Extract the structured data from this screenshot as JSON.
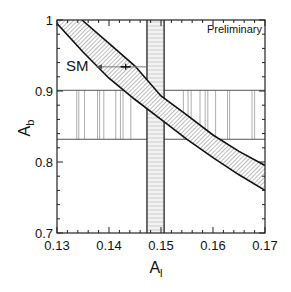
{
  "chart_data": {
    "type": "line",
    "title": "",
    "xlabel": "A",
    "xlabel_sub": "l",
    "ylabel": "A",
    "ylabel_sub": "b",
    "xlim": [
      0.13,
      0.17
    ],
    "ylim": [
      0.7,
      1.0
    ],
    "x_ticks": [
      0.13,
      0.14,
      0.15,
      0.16,
      0.17
    ],
    "x_tick_labels": [
      "0.13",
      "0.14",
      "0.15",
      "0.16",
      "0.17"
    ],
    "y_ticks": [
      0.7,
      0.8,
      0.9,
      1.0
    ],
    "y_tick_labels": [
      "0.7",
      "0.8",
      "0.9",
      "1"
    ],
    "grid": false,
    "annotations": {
      "preliminary": "Preliminary",
      "sm_label": "SM"
    },
    "series": [
      {
        "name": "SM band upper edge",
        "x": [
          0.1348,
          0.14,
          0.145,
          0.15,
          0.155,
          0.16,
          0.165,
          0.17
        ],
        "y": [
          1.0,
          0.967,
          0.935,
          0.893,
          0.866,
          0.838,
          0.815,
          0.795
        ]
      },
      {
        "name": "SM band lower edge",
        "x": [
          0.13,
          0.135,
          0.14,
          0.145,
          0.15,
          0.155,
          0.16,
          0.165,
          0.17
        ],
        "y": [
          0.995,
          0.955,
          0.918,
          0.888,
          0.86,
          0.832,
          0.806,
          0.782,
          0.76
        ]
      }
    ],
    "bands": [
      {
        "name": "A_l measurement",
        "orientation": "vertical",
        "x_range": [
          0.1473,
          0.1506
        ],
        "fill": "horizontal-hatch"
      },
      {
        "name": "A_b measurement",
        "orientation": "horizontal",
        "y_range": [
          0.832,
          0.901
        ],
        "fill": "vertical-lines"
      }
    ],
    "sm_arrow": {
      "from_x": 0.1475,
      "to_x": 0.1375,
      "y": 0.934,
      "marker_x": 0.1432
    }
  }
}
